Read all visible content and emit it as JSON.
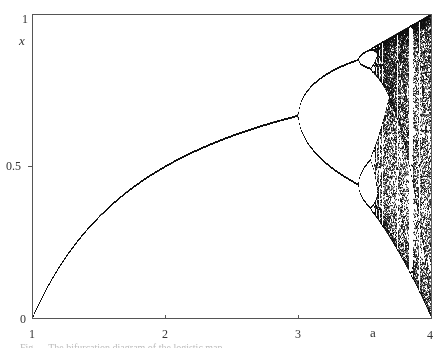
{
  "chart_data": {
    "type": "scatter",
    "title": "",
    "xlabel": "a",
    "ylabel": "x",
    "xlim": [
      1,
      4
    ],
    "ylim": [
      0,
      1
    ],
    "x_ticks": [
      1,
      2,
      3,
      4
    ],
    "x_tick_labels": [
      "1",
      "2",
      "3",
      "4"
    ],
    "y_ticks": [
      0,
      0.5,
      1
    ],
    "y_tick_labels": [
      "0",
      "0.5",
      "1"
    ],
    "grid": false,
    "legend": null,
    "series": [
      {
        "name": "fixed point x* = 1 - 1/a",
        "a_range": [
          1,
          3
        ],
        "points": [
          [
            1,
            0
          ],
          [
            1.5,
            0.333
          ],
          [
            2,
            0.5
          ],
          [
            2.5,
            0.6
          ],
          [
            3,
            0.667
          ]
        ]
      },
      {
        "name": "period-2 branches",
        "a_range": [
          3,
          3.449
        ],
        "points_upper": [
          [
            3.0,
            0.667
          ],
          [
            3.2,
            0.799
          ],
          [
            3.4,
            0.842
          ],
          [
            3.449,
            0.85
          ]
        ],
        "points_lower": [
          [
            3.0,
            0.667
          ],
          [
            3.2,
            0.513
          ],
          [
            3.4,
            0.452
          ],
          [
            3.449,
            0.44
          ]
        ]
      },
      {
        "name": "period-4 and cascade",
        "a_range": [
          3.449,
          3.57
        ]
      },
      {
        "name": "chaotic region",
        "a_range": [
          3.57,
          4
        ],
        "x_envelope_at_a4": [
          0,
          1
        ]
      }
    ],
    "render": {
      "map": "logistic",
      "a_min": 1,
      "a_max": 4,
      "columns": 400,
      "transient_iterations": 300,
      "plot_iterations": 220,
      "x0": 0.5,
      "point_color": "#111111"
    }
  },
  "axes": {
    "x_label": "a",
    "y_label": "x",
    "x_tick_labels": [
      "1",
      "2",
      "3",
      "4"
    ],
    "y_tick_labels": [
      "1",
      "0.5",
      "0"
    ]
  },
  "page": {
    "top_caption_fragment": "...",
    "bottom_caption_fragment": "Fig. ... The bifurcation diagram of the logistic map ..."
  }
}
